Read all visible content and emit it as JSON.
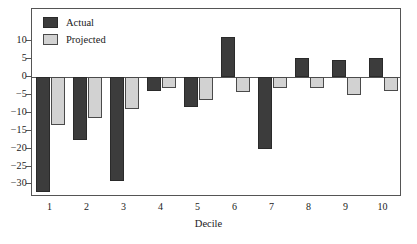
{
  "chart_data": {
    "type": "bar",
    "title": "",
    "subtitle": "",
    "xlabel": "Decile",
    "ylabel": "",
    "categories": [
      "1",
      "2",
      "3",
      "4",
      "5",
      "6",
      "7",
      "8",
      "9",
      "10"
    ],
    "series": [
      {
        "name": "Actual",
        "color": "#3c3c3c",
        "values": [
          -32.0,
          -17.5,
          -29.0,
          -4.0,
          -8.5,
          11.3,
          -20.0,
          5.4,
          4.8,
          5.4
        ]
      },
      {
        "name": "Projected",
        "color": "#d2d2d2",
        "values": [
          -13.5,
          -11.5,
          -9.0,
          -3.0,
          -6.4,
          -4.2,
          -3.0,
          -3.0,
          -5.0,
          -4.0
        ]
      }
    ],
    "ylim": [
      -33.5,
      19.0
    ],
    "yticks": [
      10,
      5,
      0,
      -5,
      -10,
      -15,
      -20,
      -25,
      -30
    ],
    "ytick_labels": [
      "10",
      "5",
      "0",
      "−5",
      "−10",
      "−15",
      "−20",
      "−25",
      "−30"
    ],
    "xticks": [
      "1",
      "2",
      "3",
      "4",
      "5",
      "6",
      "7",
      "8",
      "9",
      "10"
    ],
    "grid": false,
    "legend_position": "top-left",
    "zero_line": true
  },
  "legend": {
    "items": [
      {
        "label": "Actual",
        "swatch": "dark-gray-square"
      },
      {
        "label": "Projected",
        "swatch": "light-gray-square"
      }
    ]
  },
  "axes": {
    "x_title": "Decile"
  },
  "colors": {
    "actual": "#3c3c3c",
    "projected": "#d2d2d2",
    "frame": "#555555",
    "background": "#ffffff",
    "text": "#1a1a1a"
  }
}
